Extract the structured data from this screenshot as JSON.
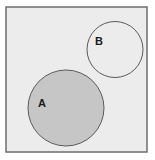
{
  "diagram": {
    "type": "venn",
    "universal_set": {
      "x": 6,
      "y": 7,
      "width": 141,
      "height": 145,
      "fill": "#ececec",
      "stroke": "#6e6e6e"
    },
    "sets": [
      {
        "label": "A",
        "cx": 66,
        "cy": 108,
        "r": 38,
        "fill": "#c6c6c6",
        "stroke": "#5a5a5a",
        "label_x": 42,
        "label_y": 107,
        "shaded": true
      },
      {
        "label": "B",
        "cx": 115,
        "cy": 49.5,
        "r": 28,
        "fill": "#ececec",
        "stroke": "#5a5a5a",
        "label_x": 99,
        "label_y": 45,
        "shaded": false
      }
    ],
    "relationship": "disjoint"
  }
}
